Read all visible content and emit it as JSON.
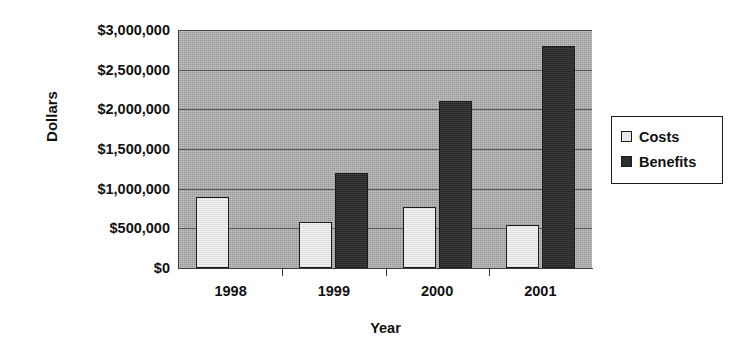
{
  "chart_data": {
    "type": "bar",
    "title": "",
    "xlabel": "Year",
    "ylabel": "Dollars",
    "categories": [
      "1998",
      "1999",
      "2000",
      "2001"
    ],
    "series": [
      {
        "name": "Costs",
        "color": "#e8e8e8",
        "values": [
          900000,
          575000,
          775000,
          545000
        ]
      },
      {
        "name": "Benefits",
        "color": "#2e2e2e",
        "values": [
          null,
          1200000,
          2100000,
          2800000
        ]
      }
    ],
    "ylim": [
      0,
      3000000
    ],
    "ytick_values": [
      0,
      500000,
      1000000,
      1500000,
      2000000,
      2500000,
      3000000
    ],
    "ytick_labels": [
      "$0",
      "$500,000",
      "$1,000,000",
      "$1,500,000",
      "$2,000,000",
      "$2,500,000",
      "$3,000,000"
    ],
    "grid": true,
    "grid_axis": "y",
    "legend_position": "right",
    "plot_background": "#a9a9a9",
    "axis_color": "#3a3a3a",
    "gridline_color": "#545454"
  },
  "legend": {
    "items": [
      {
        "label": "Costs"
      },
      {
        "label": "Benefits"
      }
    ]
  }
}
